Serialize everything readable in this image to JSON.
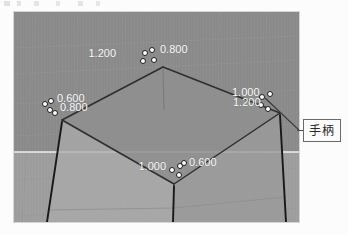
{
  "viewport": {
    "name": "3d-modeling-viewport",
    "background_color": "#8b8b8b",
    "ground_color": "#a0a0a0",
    "grid_color": "#9a9a9a",
    "axis_line_color": "#f2f2f2",
    "edge_color": "#2b2b2b",
    "top_face_color": "#8d8d8d",
    "front_left_face_color": "#a8a8a8",
    "front_right_face_color": "#9c9c9c",
    "handle_fill": "#ffffff",
    "handle_stroke": "#2b2b2b"
  },
  "dimension_labels": [
    {
      "id": "top-left-upper",
      "text": "1.200",
      "x": 122,
      "y": 54
    },
    {
      "id": "top-right-upper",
      "text": "0.800",
      "x": 158,
      "y": 52
    },
    {
      "id": "left-upper",
      "text": "0.600",
      "x": 58,
      "y": 100
    },
    {
      "id": "left-lower",
      "text": "0.800",
      "x": 58,
      "y": 107
    },
    {
      "id": "right-upper",
      "text": "1.000",
      "x": 232,
      "y": 95
    },
    {
      "id": "right-lower",
      "text": "1.200",
      "x": 232,
      "y": 102
    },
    {
      "id": "bottom-left",
      "text": "1.000",
      "x": 146,
      "y": 167
    },
    {
      "id": "bottom-right",
      "text": "0.600",
      "x": 187,
      "y": 165
    }
  ],
  "control_points": [
    {
      "id": "cp-top-a",
      "x": 145,
      "y": 53
    },
    {
      "id": "cp-top-b",
      "x": 152,
      "y": 50
    },
    {
      "id": "cp-top-c",
      "x": 143,
      "y": 61
    },
    {
      "id": "cp-top-d",
      "x": 154,
      "y": 60
    },
    {
      "id": "cp-left-a",
      "x": 45,
      "y": 104
    },
    {
      "id": "cp-left-b",
      "x": 51,
      "y": 101
    },
    {
      "id": "cp-left-c",
      "x": 50,
      "y": 110
    },
    {
      "id": "cp-left-d",
      "x": 55,
      "y": 113
    },
    {
      "id": "cp-right-a",
      "x": 262,
      "y": 97
    },
    {
      "id": "cp-right-b",
      "x": 270,
      "y": 94
    },
    {
      "id": "cp-right-c",
      "x": 261,
      "y": 105
    },
    {
      "id": "cp-right-d",
      "x": 268,
      "y": 109
    },
    {
      "id": "cp-bottom-a",
      "x": 172,
      "y": 170
    },
    {
      "id": "cp-bottom-b",
      "x": 180,
      "y": 166
    },
    {
      "id": "cp-bottom-c",
      "x": 184,
      "y": 163
    },
    {
      "id": "cp-bottom-d",
      "x": 179,
      "y": 175
    }
  ],
  "callout": {
    "label": "手柄",
    "leader_from": {
      "x": 265,
      "y": 100
    },
    "leader_to": {
      "x": 303,
      "y": 130
    }
  }
}
